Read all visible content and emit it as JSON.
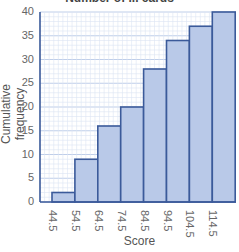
{
  "chart_data": {
    "type": "bar",
    "title": "Number of ... cards",
    "xlabel": "Score",
    "ylabel": "Cumulative frequency",
    "categories": [
      "44.5",
      "54.5",
      "64.5",
      "74.5",
      "84.5",
      "94.5",
      "104.5",
      "114.5"
    ],
    "values": [
      2,
      9,
      16,
      20,
      28,
      34,
      37,
      40
    ],
    "ylim": [
      0,
      40
    ],
    "yticks": [
      "0",
      "5",
      "10",
      "15",
      "20",
      "25",
      "30",
      "35",
      "40"
    ],
    "grid": true,
    "legend": null,
    "colors": {
      "bar_fill": "#b9c9e8",
      "bar_edge": "#3b5a9a",
      "grid_minor": "#dbe4f4",
      "grid_major": "#b8c8e6",
      "axis": "#3b5a9a"
    }
  }
}
